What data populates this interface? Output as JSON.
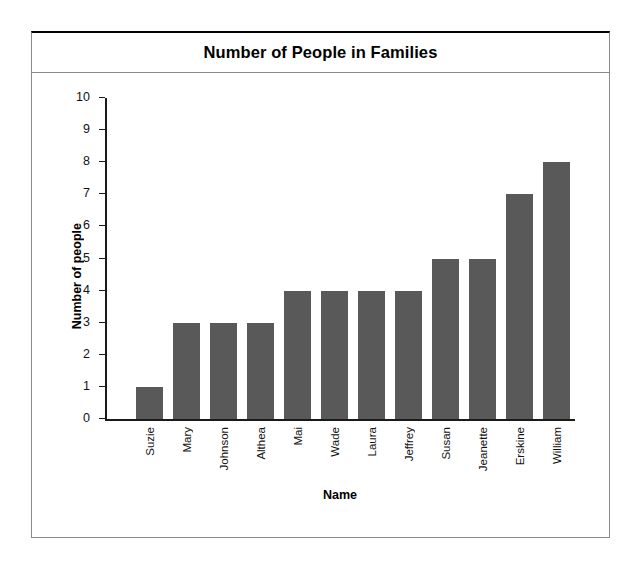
{
  "chart_data": {
    "type": "bar",
    "title": "Number of People in Families",
    "xlabel": "Name",
    "ylabel": "Number of people",
    "categories": [
      "Suzie",
      "Mary",
      "Johnson",
      "Althea",
      "Mai",
      "Wade",
      "Laura",
      "Jeffrey",
      "Susan",
      "Jeanette",
      "Erskine",
      "William"
    ],
    "values": [
      1,
      3,
      3,
      3,
      4,
      4,
      4,
      4,
      5,
      5,
      7,
      8
    ],
    "ylim": [
      0,
      10
    ],
    "y_ticks": [
      0,
      1,
      2,
      3,
      4,
      5,
      6,
      7,
      8,
      9,
      10
    ],
    "grid": false,
    "legend": null,
    "bar_color": "#595959",
    "axis_color": "#1a1a1a",
    "background": "#ffffff"
  }
}
